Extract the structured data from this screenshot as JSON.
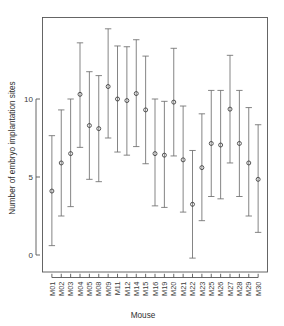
{
  "chart_data": {
    "type": "scatter",
    "title": "",
    "subtitle": "",
    "xlabel": "Mouse",
    "ylabel": "Number of embryo implantation sites",
    "grid": false,
    "legend": null,
    "ylim": [
      -0.6,
      14.6
    ],
    "yticks": [
      0,
      5,
      10
    ],
    "ytick_labels": [
      "0",
      "5",
      "10"
    ],
    "categories": [
      "M01",
      "M02",
      "M03",
      "M04",
      "M05",
      "M08",
      "M09",
      "M11",
      "M12",
      "M14",
      "M15",
      "M16",
      "M19",
      "M20",
      "M21",
      "M22",
      "M23",
      "M25",
      "M26",
      "M27",
      "M28",
      "M29",
      "M30"
    ],
    "series": [
      {
        "name": "mean",
        "values": [
          4.1,
          5.9,
          6.5,
          10.3,
          8.3,
          8.1,
          10.8,
          10.0,
          9.9,
          10.35,
          9.3,
          6.5,
          6.4,
          9.8,
          6.1,
          3.25,
          5.6,
          7.15,
          7.05,
          9.35,
          7.15,
          5.9,
          4.85
        ]
      },
      {
        "name": "lower",
        "values": [
          0.6,
          2.5,
          3.1,
          6.9,
          4.85,
          4.7,
          7.5,
          6.6,
          6.4,
          6.95,
          5.85,
          3.15,
          3.05,
          6.35,
          2.75,
          -0.2,
          2.2,
          3.75,
          3.6,
          5.9,
          3.75,
          2.5,
          1.45
        ]
      },
      {
        "name": "upper",
        "values": [
          7.65,
          9.3,
          10.0,
          13.6,
          11.75,
          11.5,
          14.5,
          13.4,
          13.35,
          13.8,
          12.75,
          10.0,
          9.85,
          13.25,
          9.55,
          6.7,
          9.05,
          10.55,
          10.55,
          12.8,
          10.55,
          9.45,
          8.35
        ]
      }
    ],
    "marker": "open-circle",
    "errorbar_style": "capped-vertical"
  },
  "axes": {
    "y_title": "Number of embryo implantation sites",
    "x_title": "Mouse"
  }
}
